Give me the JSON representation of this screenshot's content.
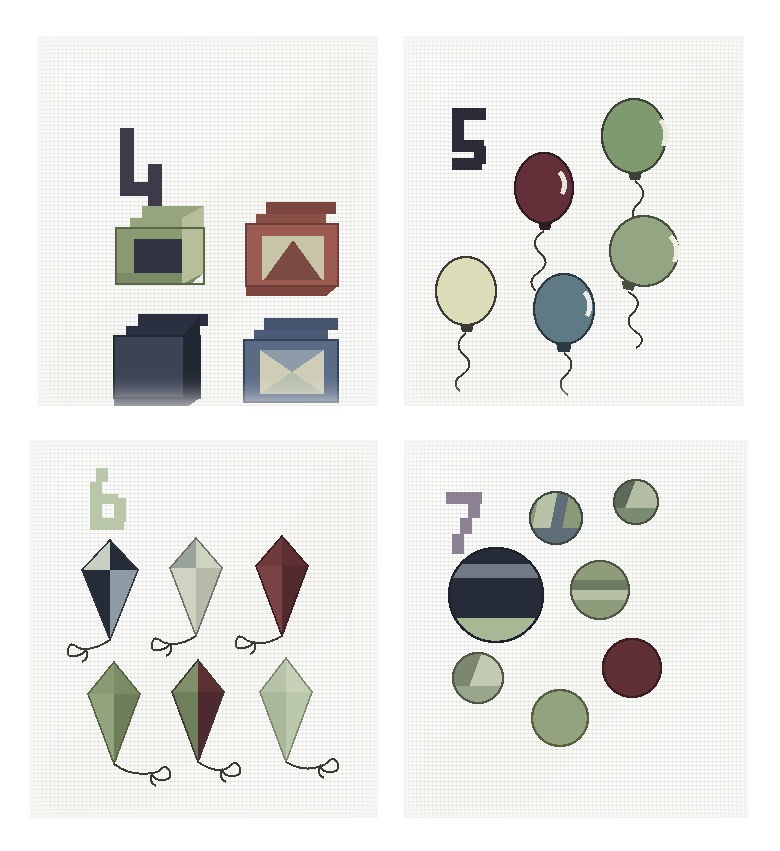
{
  "artwork": {
    "kind": "cross-stitch-sampler-photograph",
    "background_color": "#ffffff",
    "fabric_color": "#f6f6f2",
    "panel_count": 4,
    "layout": "2x2 grid of separate aida-cloth squares"
  },
  "panels": [
    {
      "id": "panel-four-blocks",
      "numeral": "4",
      "numeral_color": "#3d3b4a",
      "subject": "blocks",
      "subject_count": 4,
      "x": 38,
      "y": 36,
      "w": 340,
      "h": 370,
      "items": [
        {
          "name": "block-top-left",
          "label": "green block with dark open face",
          "colors": [
            "#8a9a72",
            "#b6bf9a",
            "#6d7d58",
            "#2f3440"
          ]
        },
        {
          "name": "block-top-right",
          "label": "red block with pyramid inside",
          "colors": [
            "#9b5a52",
            "#7d463f",
            "#c8c4a8",
            "#6b3f38"
          ]
        },
        {
          "name": "block-bottom-left",
          "label": "navy block",
          "colors": [
            "#3b4355",
            "#2b3040",
            "#4d576c",
            "#222734"
          ]
        },
        {
          "name": "block-bottom-right",
          "label": "blue block with hourglass inside",
          "colors": [
            "#5a6b86",
            "#45536b",
            "#cfcdb6",
            "#8d9aa8"
          ]
        }
      ]
    },
    {
      "id": "panel-five-balloons",
      "numeral": "5",
      "numeral_color": "#2d2b38",
      "subject": "balloons",
      "subject_count": 5,
      "x": 404,
      "y": 36,
      "w": 340,
      "h": 370,
      "items": [
        {
          "name": "balloon-green-top",
          "label": "green balloon",
          "color": "#7f9a6e"
        },
        {
          "name": "balloon-dark-red",
          "label": "dark red balloon",
          "color": "#63303a"
        },
        {
          "name": "balloon-sage-right",
          "label": "sage balloon",
          "color": "#93a582"
        },
        {
          "name": "balloon-pale-yellow",
          "label": "pale yellow balloon",
          "color": "#d9d9b4"
        },
        {
          "name": "balloon-teal-blue",
          "label": "teal blue balloon",
          "color": "#5e7a84"
        }
      ]
    },
    {
      "id": "panel-six-kites",
      "numeral": "6",
      "numeral_color": "#b9c6a8",
      "subject": "kites",
      "subject_count": 6,
      "x": 30,
      "y": 440,
      "w": 348,
      "h": 378,
      "items": [
        {
          "name": "kite-1",
          "label": "navy and pale blue kite",
          "colors": [
            "#c7cfc2",
            "#262b38",
            "#2b3040",
            "#8e9aa4"
          ]
        },
        {
          "name": "kite-2",
          "label": "grey and cream kite",
          "colors": [
            "#9aa39a",
            "#cfd3c2",
            "#b5bba8",
            "#8b9389"
          ]
        },
        {
          "name": "kite-3",
          "label": "dark red kite",
          "colors": [
            "#6f3a3c",
            "#5d2f33",
            "#7a4244",
            "#512a2e"
          ]
        },
        {
          "name": "kite-4",
          "label": "olive green kite",
          "colors": [
            "#8a9a74",
            "#7b8b66",
            "#93a37c",
            "#6e7e5b"
          ]
        },
        {
          "name": "kite-5",
          "label": "green and dark red kite",
          "colors": [
            "#7e8f6a",
            "#5e2f33",
            "#6e7f5b",
            "#4d2a2d"
          ]
        },
        {
          "name": "kite-6",
          "label": "pale sage kite",
          "colors": [
            "#b7c3a6",
            "#c6d0b6",
            "#aab79a",
            "#bcc8ac"
          ]
        }
      ]
    },
    {
      "id": "panel-seven-balls",
      "numeral": "7",
      "numeral_color": "#8b8193",
      "subject": "balls",
      "subject_count": 7,
      "x": 404,
      "y": 440,
      "w": 344,
      "h": 378,
      "items": [
        {
          "name": "ball-large-navy",
          "label": "large navy ball with green band",
          "colors": [
            "#262b38",
            "#6f7a84",
            "#a9b894"
          ]
        },
        {
          "name": "ball-striped-top",
          "label": "striped ball",
          "colors": [
            "#5f6d79",
            "#b8c2a6",
            "#8a9a76"
          ]
        },
        {
          "name": "ball-small-top-right",
          "label": "small two-tone ball",
          "colors": [
            "#7b8a72",
            "#b3bda4",
            "#5d6a5a"
          ]
        },
        {
          "name": "ball-mid-right",
          "label": "banded olive ball",
          "colors": [
            "#8e9c7c",
            "#6d7b63",
            "#b6c0a4"
          ]
        },
        {
          "name": "ball-small-left",
          "label": "small pale ball",
          "colors": [
            "#9aa68c",
            "#c2cbb2",
            "#7b886e"
          ]
        },
        {
          "name": "ball-dark-right",
          "label": "dark red ball",
          "colors": [
            "#5e3034",
            "#4b262a"
          ]
        },
        {
          "name": "ball-bottom-mid",
          "label": "sage ball",
          "colors": [
            "#94a37f",
            "#7f8e6c"
          ]
        }
      ]
    }
  ]
}
